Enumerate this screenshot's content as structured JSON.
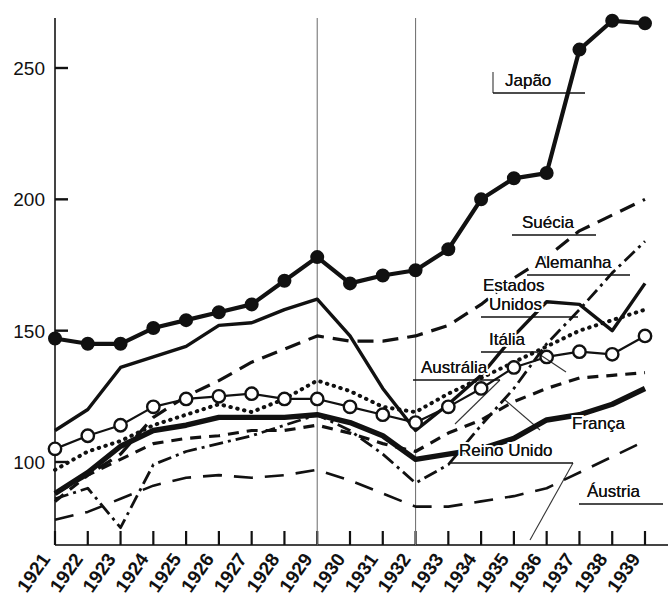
{
  "chart_data": {
    "type": "line",
    "title": "",
    "xlabel": "",
    "ylabel": "",
    "x": [
      1921,
      1922,
      1923,
      1924,
      1925,
      1926,
      1927,
      1928,
      1929,
      1930,
      1931,
      1932,
      1933,
      1934,
      1935,
      1936,
      1937,
      1938,
      1939
    ],
    "xtick_labels": [
      "1921",
      "1922",
      "1923",
      "1924",
      "1925",
      "1926",
      "1927",
      "1928",
      "1929",
      "1930",
      "1931",
      "1932",
      "1933",
      "1934",
      "1935",
      "1936",
      "1937",
      "1938",
      "1939"
    ],
    "ytick_labels": [
      "100",
      "150",
      "200",
      "250"
    ],
    "yticks": [
      100,
      150,
      200,
      250
    ],
    "ylim": [
      72,
      277
    ],
    "xlim": [
      1921,
      1939
    ],
    "grid": false,
    "legend_position": "inline-annotations",
    "reference_lines": [
      1929,
      1932
    ],
    "series": [
      {
        "name": "Japão",
        "style": "solid-thick-filled-markers",
        "marker": "filled-circle",
        "values": [
          147,
          145,
          145,
          151,
          154,
          157,
          160,
          169,
          178,
          168,
          171,
          173,
          181,
          200,
          208,
          210,
          257,
          268,
          267
        ]
      },
      {
        "name": "Suécia",
        "style": "dashed",
        "marker": "none",
        "values": [
          88,
          95,
          103,
          117,
          125,
          131,
          138,
          143,
          148,
          146,
          146,
          148,
          152,
          160,
          170,
          178,
          188,
          194,
          200
        ]
      },
      {
        "name": "Alemanha",
        "style": "dash-dot",
        "marker": "none",
        "values": [
          86,
          90,
          75,
          99,
          104,
          107,
          110,
          114,
          118,
          112,
          103,
          92,
          99,
          114,
          128,
          145,
          158,
          172,
          184
        ]
      },
      {
        "name": "Estados Unidos",
        "style": "solid-thick",
        "marker": "none",
        "values": [
          112,
          120,
          136,
          140,
          144,
          152,
          153,
          158,
          162,
          148,
          128,
          112,
          122,
          133,
          148,
          161,
          160,
          150,
          168
        ]
      },
      {
        "name": "Itália",
        "style": "dotted",
        "marker": "none",
        "values": [
          97,
          104,
          108,
          114,
          118,
          122,
          119,
          124,
          131,
          127,
          121,
          119,
          126,
          132,
          138,
          144,
          150,
          154,
          158
        ]
      },
      {
        "name": "Austrália",
        "style": "solid-open-markers",
        "marker": "open-circle",
        "values": [
          105,
          110,
          114,
          121,
          124,
          125,
          126,
          124,
          124,
          121,
          118,
          115,
          121,
          128,
          136,
          140,
          142,
          141,
          148
        ]
      },
      {
        "name": "Reino Unido",
        "style": "dashed-short",
        "marker": "none",
        "values": [
          85,
          95,
          101,
          107,
          109,
          110,
          112,
          112,
          114,
          111,
          107,
          104,
          111,
          116,
          123,
          128,
          132,
          133,
          134
        ]
      },
      {
        "name": "França",
        "style": "solid-extra-thick",
        "marker": "none",
        "values": [
          88,
          96,
          106,
          112,
          114,
          117,
          117,
          117,
          118,
          115,
          110,
          101,
          103,
          105,
          109,
          116,
          118,
          122,
          128
        ]
      },
      {
        "name": "Áustria",
        "style": "long-dashed",
        "marker": "none",
        "values": [
          78,
          81,
          86,
          91,
          94,
          95,
          94,
          95,
          97,
          93,
          88,
          83,
          83,
          85,
          87,
          90,
          96,
          102,
          108
        ]
      }
    ],
    "annotations": [
      {
        "label": "Japão",
        "x": 505,
        "y": 86,
        "underline_from": 493,
        "underline_to": 585,
        "leader": null
      },
      {
        "label": "Suécia",
        "x": 522,
        "y": 228,
        "underline_from": 512,
        "underline_to": 596,
        "leader": null
      },
      {
        "label": "Alemanha",
        "x": 535,
        "y": 268,
        "underline_from": 527,
        "underline_to": 630,
        "leader": null
      },
      {
        "label": "Estados",
        "x": 483,
        "y": 291,
        "underline_from": null,
        "underline_to": null,
        "leader": null
      },
      {
        "label": "Unidos",
        "x": 489,
        "y": 310,
        "underline_from": 481,
        "underline_to": 578,
        "leader": null
      },
      {
        "label": "Itália",
        "x": 489,
        "y": 345,
        "underline_from": 481,
        "underline_to": 536,
        "leader": null
      },
      {
        "label": "Austrália",
        "x": 421,
        "y": 373,
        "underline_from": 413,
        "underline_to": 500,
        "leader": null
      },
      {
        "label": "França",
        "x": 572,
        "y": 429,
        "underline_from": null,
        "underline_to": null,
        "leader": null
      },
      {
        "label": "Reino Unido",
        "x": 459,
        "y": 456,
        "underline_from": 451,
        "underline_to": 573,
        "leader": null
      },
      {
        "label": "Áustria",
        "x": 587,
        "y": 497,
        "underline_from": 579,
        "underline_to": 663,
        "leader": null
      }
    ]
  },
  "colors": {
    "ink": "#111111",
    "axis": "#444444",
    "background": "#ffffff",
    "reference_line": "#777777"
  }
}
